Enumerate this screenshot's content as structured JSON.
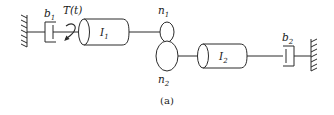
{
  "figure": {
    "caption": "(a)",
    "background_color": "#ffffff",
    "line_color": "#2b2b2b",
    "text_color": "#1a1a1a"
  },
  "labels": {
    "damper_left": {
      "base": "b",
      "sub": "1"
    },
    "torque": {
      "text": "T(t)"
    },
    "inertia_left": {
      "base": "I",
      "sub": "1"
    },
    "gear_top": {
      "base": "n",
      "sub": "1"
    },
    "gear_bottom": {
      "base": "n",
      "sub": "2"
    },
    "inertia_right": {
      "base": "I",
      "sub": "2"
    },
    "damper_right": {
      "base": "b",
      "sub": "2"
    }
  },
  "components": [
    {
      "name": "wall-left",
      "type": "fixed-support"
    },
    {
      "name": "damper-b1",
      "type": "dashpot"
    },
    {
      "name": "torque-arrow",
      "type": "curved-arrow"
    },
    {
      "name": "inertia-I1",
      "type": "cylinder"
    },
    {
      "name": "gear-n1",
      "type": "gear-ellipse"
    },
    {
      "name": "gear-n2",
      "type": "gear-ellipse"
    },
    {
      "name": "inertia-I2",
      "type": "cylinder"
    },
    {
      "name": "damper-b2",
      "type": "dashpot"
    },
    {
      "name": "wall-right",
      "type": "fixed-support"
    }
  ]
}
